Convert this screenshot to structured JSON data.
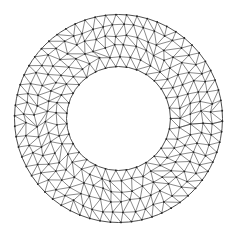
{
  "figure": {
    "width": 236,
    "height": 237,
    "background": "#ffffff",
    "center": [
      118.5,
      118.5
    ],
    "outer_radius": 104,
    "inner_radius": 52,
    "line_color": "#3a3a3a",
    "node_color": "#222222",
    "mesh": {
      "element_type": "triangle",
      "radial_layers": 6,
      "target_edge_length": 10.5,
      "jitter": 0.28,
      "seed": 7
    }
  }
}
